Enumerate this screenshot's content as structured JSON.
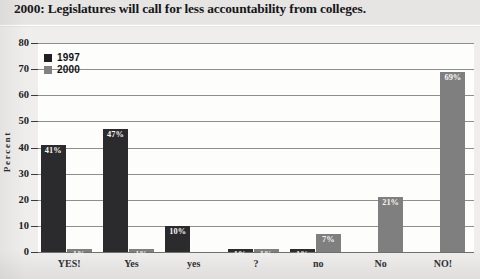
{
  "chart_data": {
    "type": "bar",
    "title": "2000: Legislatures will call for less accountability from colleges.",
    "xlabel": "",
    "ylabel": "Percent",
    "ylim": [
      0,
      80
    ],
    "yticks": [
      0,
      10,
      20,
      30,
      40,
      50,
      60,
      70,
      80
    ],
    "ytick_labels": [
      "0",
      "10",
      "20",
      "30",
      "40",
      "50",
      "60",
      "70",
      "80"
    ],
    "grid": true,
    "legend_position": "upper-left",
    "categories": [
      "YES!",
      "Yes",
      "yes",
      "?",
      "no",
      "No",
      "NO!"
    ],
    "series": [
      {
        "name": "1997",
        "color": "#2b2b2d",
        "values": [
          41,
          47,
          10,
          1,
          1,
          null,
          null
        ],
        "labels": [
          "41%",
          "47%",
          "10%",
          "1%",
          "1%",
          "",
          ""
        ]
      },
      {
        "name": "2000",
        "color": "#7f7f80",
        "values": [
          1,
          1,
          null,
          1,
          7,
          21,
          69
        ],
        "labels": [
          "1%",
          "1%",
          "",
          "1%",
          "7%",
          "21%",
          "69%"
        ]
      }
    ],
    "value_label_suffix": "%"
  },
  "legend": {
    "items": [
      {
        "label": "1997",
        "color": "#2b2b2d"
      },
      {
        "label": "2000",
        "color": "#7f7f80"
      }
    ]
  },
  "colors": {
    "series_1997": "#2b2b2d",
    "series_2000": "#7f7f80",
    "plot_background": "#fdfdfc",
    "figure_background": "#efeeec",
    "gridline": "#8e8e8c",
    "axis": "#59595a",
    "text": "#1b1b1d"
  }
}
